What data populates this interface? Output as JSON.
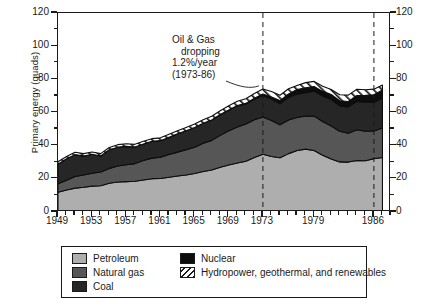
{
  "chart_data": {
    "type": "area",
    "title": "",
    "xlabel": "",
    "ylabel": "Primary energy (quads)",
    "xlim": [
      1949,
      1988
    ],
    "ylim": [
      0,
      120
    ],
    "yticks": [
      0,
      20,
      40,
      60,
      80,
      100,
      120
    ],
    "xticks": [
      1949,
      1953,
      1957,
      1961,
      1965,
      1969,
      1973,
      1979,
      1986
    ],
    "grid": false,
    "legend_position": "below-plot",
    "stacked": true,
    "stack_order_bottom_to_top": [
      "Petroleum",
      "Natural gas",
      "Coal",
      "Nuclear",
      "Hydropower, geothermal, and renewables"
    ],
    "x": [
      1949,
      1950,
      1951,
      1952,
      1953,
      1954,
      1955,
      1956,
      1957,
      1958,
      1959,
      1960,
      1961,
      1962,
      1963,
      1964,
      1965,
      1966,
      1967,
      1968,
      1969,
      1970,
      1971,
      1972,
      1973,
      1974,
      1975,
      1976,
      1977,
      1978,
      1979,
      1980,
      1981,
      1982,
      1983,
      1984,
      1985,
      1986,
      1987
    ],
    "series": [
      {
        "name": "Petroleum",
        "color": "#aeaeae",
        "values": [
          11.9,
          13.3,
          14.4,
          14.9,
          15.6,
          15.8,
          17.3,
          18.1,
          18.3,
          18.5,
          19.3,
          20.1,
          20.2,
          21.0,
          21.7,
          22.3,
          23.2,
          24.4,
          25.3,
          27.0,
          28.3,
          29.5,
          30.6,
          32.9,
          34.8,
          33.5,
          32.7,
          35.2,
          37.1,
          37.9,
          37.1,
          34.2,
          31.9,
          30.2,
          30.1,
          31.1,
          30.9,
          32.2,
          32.9
        ]
      },
      {
        "name": "Natural gas",
        "color": "#565656",
        "values": [
          5.1,
          5.9,
          7.0,
          7.4,
          7.8,
          8.3,
          9.0,
          9.6,
          10.2,
          10.7,
          11.7,
          12.4,
          12.9,
          13.7,
          14.4,
          15.3,
          15.8,
          17.0,
          17.9,
          19.2,
          20.7,
          21.8,
          22.5,
          22.7,
          22.5,
          21.7,
          19.9,
          20.3,
          19.9,
          20.0,
          20.7,
          20.4,
          19.9,
          18.5,
          17.4,
          18.5,
          17.8,
          16.7,
          17.7
        ]
      },
      {
        "name": "Coal",
        "color": "#262626",
        "values": [
          11.9,
          12.9,
          13.2,
          11.4,
          11.4,
          9.7,
          11.2,
          11.4,
          11.1,
          10.0,
          10.0,
          10.1,
          9.9,
          10.3,
          11.0,
          11.4,
          11.9,
          12.1,
          12.2,
          12.4,
          12.4,
          12.7,
          12.0,
          12.4,
          13.0,
          12.9,
          12.7,
          13.6,
          14.1,
          14.0,
          15.1,
          15.4,
          16.0,
          15.3,
          15.9,
          17.1,
          17.5,
          17.3,
          18.0
        ]
      },
      {
        "name": "Nuclear",
        "color": "#0d0d0d",
        "values": [
          0,
          0,
          0,
          0,
          0,
          0,
          0,
          0,
          0,
          0,
          0,
          0.02,
          0.02,
          0.03,
          0.04,
          0.04,
          0.04,
          0.06,
          0.09,
          0.14,
          0.15,
          0.24,
          0.41,
          0.58,
          0.91,
          1.27,
          1.9,
          2.11,
          2.7,
          3.02,
          2.78,
          2.74,
          3.01,
          3.13,
          3.2,
          3.55,
          4.15,
          4.47,
          4.91
        ]
      },
      {
        "name": "Hydropower, geothermal, and renewables",
        "color": "#ffffff",
        "hatch": "diagonal",
        "values": [
          1.4,
          1.4,
          1.4,
          1.5,
          1.4,
          1.4,
          1.4,
          1.5,
          1.6,
          1.6,
          1.6,
          1.6,
          1.7,
          1.8,
          1.8,
          1.9,
          2.1,
          2.1,
          2.3,
          2.3,
          2.5,
          2.6,
          2.8,
          2.9,
          3.0,
          3.3,
          3.2,
          3.1,
          2.5,
          3.1,
          3.1,
          3.1,
          3.1,
          3.6,
          3.9,
          3.8,
          3.4,
          3.4,
          3.0
        ]
      }
    ],
    "annotations": [
      {
        "name": "oil-gas-decline-note",
        "lines": [
          "Oil & Gas",
          "dropping",
          "1.2%/year",
          "(1973-86)"
        ],
        "leader_to_year": 1973
      }
    ],
    "reference_lines": [
      {
        "name": "ref-1973",
        "year": 1973,
        "style": "dashed"
      },
      {
        "name": "ref-1986",
        "year": 1986,
        "style": "dashed"
      }
    ]
  },
  "axes": {
    "y_title": "Primary energy (quads)",
    "y_tick_labels": [
      "0",
      "20",
      "40",
      "60",
      "80",
      "100",
      "120"
    ],
    "x_tick_labels": [
      "1949",
      "1953",
      "1957",
      "1961",
      "1965",
      "1969",
      "1973",
      "1979",
      "1986"
    ]
  },
  "annotation": {
    "line1": "Oil & Gas",
    "line2": "dropping",
    "line3": "1.2%/year",
    "line4": "(1973-86)"
  },
  "legend": {
    "items": [
      {
        "label": "Petroleum",
        "swatch": "petroleum-swatch"
      },
      {
        "label": "Natural gas",
        "swatch": "natural-gas-swatch"
      },
      {
        "label": "Coal",
        "swatch": "coal-swatch"
      },
      {
        "label": "Nuclear",
        "swatch": "nuclear-swatch"
      },
      {
        "label": "Hydropower, geothermal, and renewables",
        "swatch": "hydropower-swatch"
      }
    ]
  }
}
